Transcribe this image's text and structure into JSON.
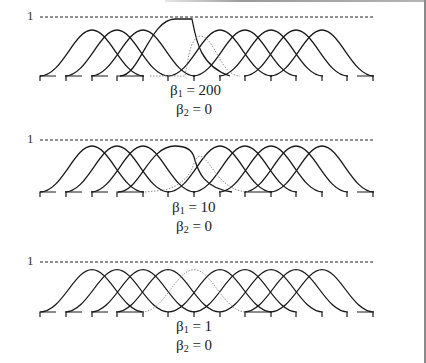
{
  "figure": {
    "colors": {
      "line": "#1a1a1a",
      "dotted": "#8c8c8c",
      "background": "#ffffff"
    },
    "panels": [
      {
        "id": "panel-1",
        "unit_label": "1",
        "beta1_label": "β",
        "beta1_sub": "1",
        "beta1_value": " = 200",
        "beta2_label": "β",
        "beta2_sub": "2",
        "beta2_value": " = 0",
        "modified_curve": "sigmoid saturating at 1 then dropping sharply",
        "dotted_curve_index": 5
      },
      {
        "id": "panel-2",
        "unit_label": "1",
        "beta1_label": "β",
        "beta1_sub": "1",
        "beta1_value": " = 10",
        "beta2_label": "β",
        "beta2_sub": "2",
        "beta2_value": " = 0",
        "modified_curve": "broadened rounded peak then drop",
        "dotted_curve_index": 5
      },
      {
        "id": "panel-3",
        "unit_label": "1",
        "beta1_label": "β",
        "beta1_sub": "1",
        "beta1_value": " = 1",
        "beta2_label": "β",
        "beta2_sub": "2",
        "beta2_value": " = 0",
        "modified_curve": "none (all standard bells)",
        "dotted_curve_index": 5
      }
    ],
    "curve_count": 10,
    "tick_count": 14
  }
}
